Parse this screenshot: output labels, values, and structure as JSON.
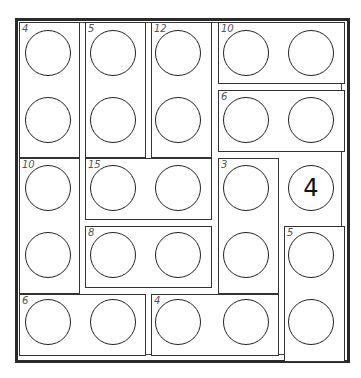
{
  "puzzle": {
    "type": "sum-cage number puzzle",
    "grid_size": [
      5,
      5
    ],
    "cages": [
      {
        "label": "4",
        "cells": [
          [
            0,
            0
          ],
          [
            1,
            0
          ]
        ]
      },
      {
        "label": "5",
        "cells": [
          [
            0,
            1
          ],
          [
            1,
            1
          ]
        ]
      },
      {
        "label": "12",
        "cells": [
          [
            0,
            2
          ],
          [
            1,
            2
          ]
        ]
      },
      {
        "label": "10",
        "cells": [
          [
            0,
            3
          ],
          [
            0,
            4
          ]
        ]
      },
      {
        "label": "6",
        "cells": [
          [
            1,
            3
          ],
          [
            1,
            4
          ]
        ]
      },
      {
        "label": "10",
        "cells": [
          [
            2,
            0
          ],
          [
            3,
            0
          ]
        ]
      },
      {
        "label": "15",
        "cells": [
          [
            2,
            1
          ],
          [
            2,
            2
          ]
        ]
      },
      {
        "label": "3",
        "cells": [
          [
            2,
            3
          ],
          [
            3,
            3
          ]
        ]
      },
      {
        "label": "8",
        "cells": [
          [
            3,
            1
          ],
          [
            3,
            2
          ]
        ]
      },
      {
        "label": "5",
        "cells": [
          [
            3,
            4
          ],
          [
            4,
            4
          ]
        ]
      },
      {
        "label": "6",
        "cells": [
          [
            4,
            0
          ],
          [
            4,
            1
          ]
        ]
      },
      {
        "label": "4",
        "cells": [
          [
            4,
            2
          ],
          [
            4,
            3
          ]
        ]
      }
    ],
    "cells": [
      [
        "",
        "",
        "",
        "",
        ""
      ],
      [
        "",
        "",
        "",
        "",
        ""
      ],
      [
        "",
        "",
        "",
        "",
        "4"
      ],
      [
        "",
        "",
        "",
        "",
        ""
      ],
      [
        "",
        "",
        "",
        "",
        ""
      ]
    ],
    "given": {
      "row": 2,
      "col": 4,
      "value": "4"
    }
  }
}
